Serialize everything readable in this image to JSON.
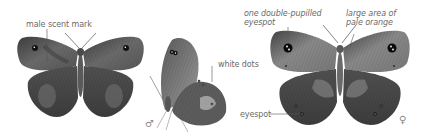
{
  "figure": {
    "specimens": [
      {
        "id": "male-upperside",
        "view": "upperside",
        "sex": "male"
      },
      {
        "id": "male-underside",
        "view": "underside (side view)",
        "sex": "male"
      },
      {
        "id": "female-upperside",
        "view": "upperside",
        "sex": "female"
      }
    ],
    "labels": {
      "male_scent_mark": "male scent mark",
      "white_dots": "white dots",
      "double_pupilled_line1": "one double-pupilled",
      "double_pupilled_line2": "eyespot",
      "pale_orange_line1": "large area of",
      "pale_orange_line2": "pale orange",
      "eyespot": "eyespot"
    },
    "symbols": {
      "male": "♂",
      "female": "♀"
    },
    "colors": {
      "background": "#ffffff",
      "label_text": "#6a6a6a",
      "leader_line": "#555555",
      "wing_dark": "#4a4a4a",
      "wing_mid": "#6e6e6e",
      "wing_light": "#9a9a9a",
      "eyespot": "#111111"
    }
  }
}
